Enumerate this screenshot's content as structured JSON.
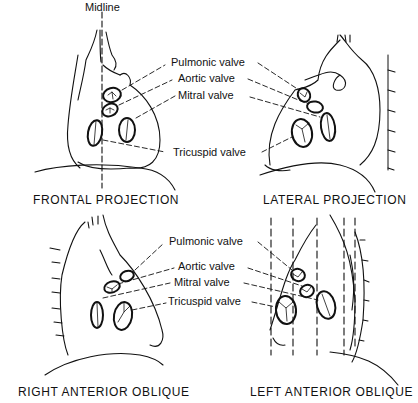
{
  "figure": {
    "midline_label": "Midline",
    "panels": [
      {
        "id": "frontal",
        "caption": "FRONTAL PROJECTION"
      },
      {
        "id": "lateral",
        "caption": "LATERAL PROJECTION"
      },
      {
        "id": "rao",
        "caption": "RIGHT ANTERIOR OBLIQUE"
      },
      {
        "id": "lao",
        "caption": "LEFT ANTERIOR OBLIQUE"
      }
    ],
    "top_labels": {
      "pulmonic": "Pulmonic valve",
      "aortic": "Aortic valve",
      "mitral": "Mitral valve",
      "tricuspid": "Tricuspid valve"
    },
    "bottom_labels": {
      "pulmonic": "Pulmonic valve",
      "aortic": "Aortic valve",
      "mitral": "Mitral valve",
      "tricuspid": "Tricuspid valve"
    },
    "colors": {
      "ink": "#111111",
      "background": "#ffffff"
    }
  }
}
